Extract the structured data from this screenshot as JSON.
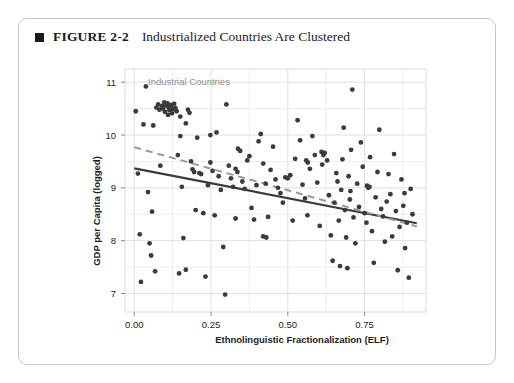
{
  "figure": {
    "bullet": "filled-square",
    "number": "FIGURE 2-2",
    "title": "Industrialized Countries Are Clustered"
  },
  "chart_data": {
    "type": "scatter",
    "title": "Industrialized Countries Are Clustered",
    "xlabel": "Ethnolinguistic Fractionalization (ELF)",
    "ylabel": "GDP per Capita (logged)",
    "xlim": [
      -0.03,
      0.95
    ],
    "ylim": [
      6.65,
      11.25
    ],
    "xticks": [
      0.0,
      0.25,
      0.5,
      0.75
    ],
    "xticklabels": [
      "0.00",
      "0.25",
      "0.50",
      "0.75"
    ],
    "yticks": [
      7,
      8,
      9,
      10,
      11
    ],
    "yticklabels": [
      "7",
      "8",
      "9",
      "10",
      "11"
    ],
    "grid": true,
    "grid_minor": true,
    "grid_color": "#d8d8d8",
    "point_color": "#3b3b3b",
    "point_radius": 2.4,
    "legend": "none",
    "annotations": [
      {
        "text": "Industrial Countries",
        "x": 0.045,
        "y": 10.95,
        "color": "#8e8e8e"
      }
    ],
    "series": [
      {
        "name": "Countries",
        "points": [
          [
            0.005,
            10.45
          ],
          [
            0.012,
            9.27
          ],
          [
            0.018,
            8.12
          ],
          [
            0.022,
            7.22
          ],
          [
            0.03,
            10.2
          ],
          [
            0.038,
            10.92
          ],
          [
            0.045,
            8.92
          ],
          [
            0.05,
            7.95
          ],
          [
            0.055,
            7.72
          ],
          [
            0.058,
            8.55
          ],
          [
            0.062,
            10.18
          ],
          [
            0.068,
            7.42
          ],
          [
            0.072,
            10.52
          ],
          [
            0.078,
            10.58
          ],
          [
            0.082,
            10.48
          ],
          [
            0.085,
            9.42
          ],
          [
            0.09,
            10.55
          ],
          [
            0.094,
            10.5
          ],
          [
            0.098,
            10.62
          ],
          [
            0.1,
            10.44
          ],
          [
            0.104,
            10.56
          ],
          [
            0.108,
            10.6
          ],
          [
            0.11,
            10.38
          ],
          [
            0.112,
            10.52
          ],
          [
            0.115,
            10.47
          ],
          [
            0.118,
            10.57
          ],
          [
            0.12,
            10.54
          ],
          [
            0.123,
            10.41
          ],
          [
            0.126,
            10.49
          ],
          [
            0.13,
            10.59
          ],
          [
            0.134,
            10.51
          ],
          [
            0.138,
            10.45
          ],
          [
            0.142,
            9.62
          ],
          [
            0.146,
            7.38
          ],
          [
            0.15,
            10.35
          ],
          [
            0.155,
            9.02
          ],
          [
            0.16,
            8.05
          ],
          [
            0.168,
            7.45
          ],
          [
            0.175,
            10.48
          ],
          [
            0.18,
            10.42
          ],
          [
            0.185,
            9.5
          ],
          [
            0.19,
            9.35
          ],
          [
            0.195,
            9.3
          ],
          [
            0.2,
            8.58
          ],
          [
            0.205,
            9.95
          ],
          [
            0.212,
            9.28
          ],
          [
            0.218,
            9.26
          ],
          [
            0.225,
            8.52
          ],
          [
            0.232,
            7.32
          ],
          [
            0.24,
            9.05
          ],
          [
            0.248,
            9.48
          ],
          [
            0.255,
            9.32
          ],
          [
            0.262,
            8.48
          ],
          [
            0.268,
            10.05
          ],
          [
            0.275,
            9.22
          ],
          [
            0.282,
            8.96
          ],
          [
            0.29,
            7.88
          ],
          [
            0.296,
            6.98
          ],
          [
            0.3,
            10.58
          ],
          [
            0.308,
            9.42
          ],
          [
            0.315,
            9.18
          ],
          [
            0.322,
            9.02
          ],
          [
            0.33,
            8.42
          ],
          [
            0.338,
            9.74
          ],
          [
            0.345,
            9.7
          ],
          [
            0.352,
            9.12
          ],
          [
            0.36,
            8.98
          ],
          [
            0.368,
            9.52
          ],
          [
            0.375,
            9.6
          ],
          [
            0.382,
            8.62
          ],
          [
            0.39,
            8.4
          ],
          [
            0.398,
            9.05
          ],
          [
            0.405,
            9.88
          ],
          [
            0.412,
            10.02
          ],
          [
            0.42,
            9.46
          ],
          [
            0.428,
            9.08
          ],
          [
            0.436,
            8.45
          ],
          [
            0.444,
            9.34
          ],
          [
            0.452,
            9.78
          ],
          [
            0.46,
            9.16
          ],
          [
            0.468,
            9.0
          ],
          [
            0.476,
            8.9
          ],
          [
            0.484,
            8.72
          ],
          [
            0.492,
            9.2
          ],
          [
            0.5,
            9.18
          ],
          [
            0.508,
            9.24
          ],
          [
            0.516,
            8.38
          ],
          [
            0.524,
            9.55
          ],
          [
            0.532,
            10.28
          ],
          [
            0.54,
            9.9
          ],
          [
            0.548,
            9.06
          ],
          [
            0.556,
            8.8
          ],
          [
            0.564,
            8.48
          ],
          [
            0.572,
            9.36
          ],
          [
            0.58,
            9.98
          ],
          [
            0.588,
            9.62
          ],
          [
            0.596,
            9.1
          ],
          [
            0.604,
            8.28
          ],
          [
            0.612,
            9.44
          ],
          [
            0.62,
            9.66
          ],
          [
            0.628,
            9.52
          ],
          [
            0.634,
            8.86
          ],
          [
            0.64,
            8.1
          ],
          [
            0.646,
            7.62
          ],
          [
            0.652,
            8.72
          ],
          [
            0.658,
            9.28
          ],
          [
            0.662,
            9.12
          ],
          [
            0.666,
            8.38
          ],
          [
            0.67,
            7.52
          ],
          [
            0.674,
            8.96
          ],
          [
            0.678,
            9.54
          ],
          [
            0.682,
            10.14
          ],
          [
            0.686,
            8.58
          ],
          [
            0.69,
            8.06
          ],
          [
            0.694,
            7.48
          ],
          [
            0.698,
            9.22
          ],
          [
            0.702,
            8.78
          ],
          [
            0.706,
            9.72
          ],
          [
            0.71,
            10.86
          ],
          [
            0.714,
            8.44
          ],
          [
            0.72,
            7.95
          ],
          [
            0.726,
            9.08
          ],
          [
            0.732,
            8.64
          ],
          [
            0.738,
            9.86
          ],
          [
            0.744,
            9.4
          ],
          [
            0.75,
            8.52
          ],
          [
            0.756,
            8.34
          ],
          [
            0.762,
            9.0
          ],
          [
            0.768,
            9.58
          ],
          [
            0.774,
            8.18
          ],
          [
            0.78,
            7.58
          ],
          [
            0.786,
            8.82
          ],
          [
            0.792,
            9.3
          ],
          [
            0.798,
            10.1
          ],
          [
            0.804,
            8.6
          ],
          [
            0.81,
            8.46
          ],
          [
            0.816,
            7.98
          ],
          [
            0.822,
            8.74
          ],
          [
            0.828,
            9.26
          ],
          [
            0.834,
            8.88
          ],
          [
            0.84,
            8.08
          ],
          [
            0.846,
            9.64
          ],
          [
            0.852,
            8.56
          ],
          [
            0.858,
            7.44
          ],
          [
            0.864,
            8.26
          ],
          [
            0.87,
            9.16
          ],
          [
            0.876,
            8.66
          ],
          [
            0.882,
            7.86
          ],
          [
            0.888,
            8.34
          ],
          [
            0.894,
            7.3
          ],
          [
            0.9,
            8.98
          ],
          [
            0.906,
            8.5
          ],
          [
            0.15,
            9.98
          ],
          [
            0.168,
            10.22
          ],
          [
            0.42,
            8.08
          ],
          [
            0.43,
            8.06
          ],
          [
            0.56,
            9.52
          ],
          [
            0.565,
            9.48
          ],
          [
            0.33,
            9.36
          ],
          [
            0.336,
            9.3
          ],
          [
            0.248,
            10.0
          ],
          [
            0.61,
            9.68
          ],
          [
            0.616,
            9.62
          ],
          [
            0.704,
            8.94
          ],
          [
            0.758,
            9.04
          ],
          [
            0.766,
            9.02
          ],
          [
            0.88,
            8.9
          ]
        ]
      }
    ],
    "trendlines": [
      {
        "name": "all-countries-fit",
        "style": "solid",
        "color": "#3b3b3b",
        "width": 2.2,
        "x0": 0.0,
        "y0": 9.37,
        "x1": 0.92,
        "y1": 8.33
      },
      {
        "name": "excluding-industrial-fit",
        "style": "dashed",
        "color": "#9a9a9a",
        "width": 2.0,
        "x0": 0.0,
        "y0": 9.77,
        "x1": 0.92,
        "y1": 8.27
      }
    ]
  }
}
